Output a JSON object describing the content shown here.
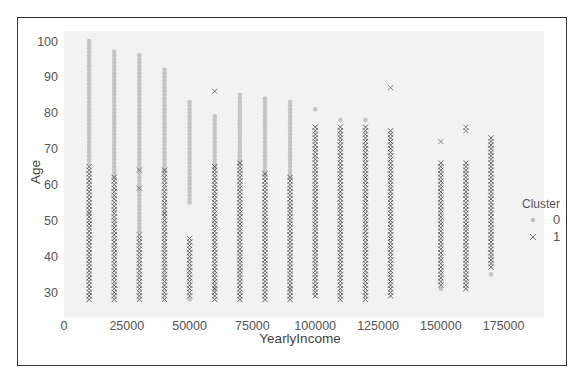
{
  "chart_data": {
    "type": "scatter",
    "title": "",
    "xlabel": "YearlyIncome",
    "ylabel": "Age",
    "xlim": [
      0,
      190000
    ],
    "ylim": [
      25,
      102
    ],
    "x_ticks": [
      "0",
      "25000",
      "50000",
      "75000",
      "100000",
      "125000",
      "150000",
      "175000"
    ],
    "y_ticks": [
      "30",
      "40",
      "50",
      "60",
      "70",
      "80",
      "90",
      "100"
    ],
    "grid": false,
    "legend": {
      "title": "Cluster",
      "position": "right",
      "entries": [
        {
          "label": "0",
          "marker": "o",
          "color": "#bdbdbd"
        },
        {
          "label": "1",
          "marker": "x",
          "color": "#555555"
        }
      ]
    },
    "series": [
      {
        "name": "0",
        "marker": "circle",
        "color": "#bdbdbd",
        "columns": [
          {
            "x": 10000,
            "age_range": [
              66,
              100
            ],
            "extra": [
              52,
              93
            ]
          },
          {
            "x": 20000,
            "age_range": [
              62,
              97
            ],
            "extra": []
          },
          {
            "x": 30000,
            "age_range": [
              47,
              96
            ],
            "extra": []
          },
          {
            "x": 40000,
            "age_range": [
              64,
              92
            ],
            "extra": [
              52
            ]
          },
          {
            "x": 50000,
            "age_range": [
              55,
              83
            ],
            "extra": [
              28
            ]
          },
          {
            "x": 60000,
            "age_range": [
              65,
              79
            ],
            "extra": [
              31
            ]
          },
          {
            "x": 70000,
            "age_range": [
              66,
              85
            ],
            "extra": []
          },
          {
            "x": 80000,
            "age_range": [
              63,
              84
            ],
            "extra": []
          },
          {
            "x": 90000,
            "age_range": [
              62,
              83
            ],
            "extra": [
              31
            ]
          },
          {
            "x": 100000,
            "age_range": [
              81,
              81
            ],
            "extra": []
          },
          {
            "x": 110000,
            "age_range": [
              78,
              78
            ],
            "extra": []
          },
          {
            "x": 120000,
            "age_range": [
              78,
              78
            ],
            "extra": []
          },
          {
            "x": 150000,
            "age_range": [
              31,
              31
            ],
            "extra": []
          },
          {
            "x": 170000,
            "age_range": [
              35,
              35
            ],
            "extra": []
          }
        ]
      },
      {
        "name": "1",
        "marker": "x",
        "color": "#555555",
        "columns": [
          {
            "x": 10000,
            "age_range": [
              28,
              65
            ],
            "extra": []
          },
          {
            "x": 20000,
            "age_range": [
              28,
              62
            ],
            "extra": []
          },
          {
            "x": 30000,
            "age_range": [
              28,
              46
            ],
            "extra": [
              59,
              64
            ]
          },
          {
            "x": 40000,
            "age_range": [
              28,
              64
            ],
            "extra": []
          },
          {
            "x": 50000,
            "age_range": [
              29,
              45
            ],
            "extra": []
          },
          {
            "x": 60000,
            "age_range": [
              28,
              65
            ],
            "extra": [
              86
            ]
          },
          {
            "x": 70000,
            "age_range": [
              28,
              66
            ],
            "extra": []
          },
          {
            "x": 80000,
            "age_range": [
              28,
              63
            ],
            "extra": []
          },
          {
            "x": 90000,
            "age_range": [
              28,
              62
            ],
            "extra": []
          },
          {
            "x": 100000,
            "age_range": [
              29,
              76
            ],
            "extra": []
          },
          {
            "x": 110000,
            "age_range": [
              28,
              76
            ],
            "extra": []
          },
          {
            "x": 120000,
            "age_range": [
              28,
              76
            ],
            "extra": []
          },
          {
            "x": 130000,
            "age_range": [
              29,
              75
            ],
            "extra": [
              87
            ]
          },
          {
            "x": 150000,
            "age_range": [
              32,
              66
            ],
            "extra": [
              72
            ]
          },
          {
            "x": 160000,
            "age_range": [
              31,
              66
            ],
            "extra": [
              75,
              76
            ]
          },
          {
            "x": 170000,
            "age_range": [
              37,
              73
            ],
            "extra": []
          }
        ]
      }
    ]
  }
}
